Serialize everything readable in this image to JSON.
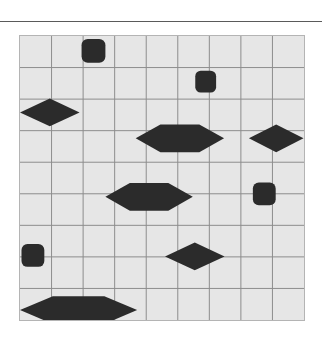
{
  "figure": {
    "title": "",
    "background_color": "#ffffff",
    "rule": {
      "name": "top-horizontal-rule",
      "x": 0,
      "y": 21,
      "width": 322,
      "height": 1,
      "color": "#5a5a5a"
    },
    "panel": {
      "x": 19,
      "y": 35,
      "width": 286,
      "height": 286,
      "fill_color": "#e6e6e6",
      "border_color": "#b4b4b4",
      "grid_line_color": "#8c8c8c",
      "columns": 9,
      "rows": 9,
      "cell_width": 31.78,
      "cell_height": 31.78,
      "grid_on": true
    },
    "shape_color": "#2b2b2b"
  },
  "chart_data": {
    "type": "scatter",
    "title": "",
    "xlabel": "",
    "ylabel": "",
    "xlim": [
      0,
      9
    ],
    "ylim": [
      0,
      9
    ],
    "grid": true,
    "legend": null,
    "tick_labels_x": [],
    "tick_labels_y": [],
    "shape_color": "#2b2b2b",
    "background_color": "#e6e6e6",
    "marker_kinds": [
      "rounded-square",
      "diamond",
      "hexagon"
    ],
    "counts": {
      "rounded-square": 4,
      "diamond": 3,
      "hexagon": 3,
      "total": 10
    },
    "markers": [
      {
        "id": "marker-1",
        "kind": "rounded-square",
        "cell_col": 2,
        "cell_row": 0,
        "center_x": 93,
        "center_y": 50,
        "width": 24,
        "height": 24
      },
      {
        "id": "marker-2",
        "kind": "rounded-square",
        "cell_col": 5,
        "cell_row": 1,
        "center_x": 206,
        "center_y": 81,
        "width": 21,
        "height": 22
      },
      {
        "id": "marker-3",
        "kind": "diamond",
        "cell_col": 0,
        "cell_row": 2,
        "center_x": 49,
        "center_y": 112,
        "width": 60,
        "height": 28
      },
      {
        "id": "marker-4",
        "kind": "hexagon",
        "cell_col": 4,
        "cell_row": 3,
        "center_x": 180,
        "center_y": 138,
        "width": 89,
        "height": 28
      },
      {
        "id": "marker-5",
        "kind": "diamond",
        "cell_col": 8,
        "cell_row": 3,
        "center_x": 277,
        "center_y": 138,
        "width": 55,
        "height": 28
      },
      {
        "id": "marker-6",
        "kind": "hexagon",
        "cell_col": 3,
        "cell_row": 5,
        "center_x": 149,
        "center_y": 197,
        "width": 88,
        "height": 28
      },
      {
        "id": "marker-7",
        "kind": "rounded-square",
        "cell_col": 7,
        "cell_row": 5,
        "center_x": 265,
        "center_y": 194,
        "width": 23,
        "height": 23
      },
      {
        "id": "marker-8",
        "kind": "rounded-square",
        "cell_col": 0,
        "cell_row": 7,
        "center_x": 32,
        "center_y": 256,
        "width": 23,
        "height": 23
      },
      {
        "id": "marker-9",
        "kind": "diamond",
        "cell_col": 5,
        "cell_row": 7,
        "center_x": 195,
        "center_y": 257,
        "width": 60,
        "height": 28
      },
      {
        "id": "marker-10",
        "kind": "hexagon",
        "cell_col": 1,
        "cell_row": 8,
        "center_x": 78,
        "center_y": 311,
        "width": 118,
        "height": 28
      }
    ]
  }
}
